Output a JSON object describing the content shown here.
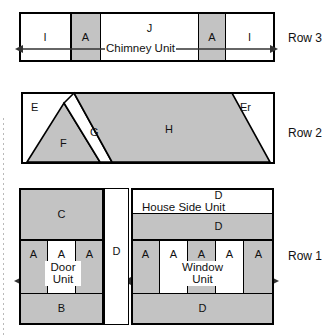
{
  "diagram": {
    "fill_gray": "#c3c3c3",
    "fill_white": "#ffffff",
    "line_color": "#000000"
  },
  "row_labels": {
    "row3": "Row 3",
    "row2": "Row 2",
    "row1": "Row 1"
  },
  "row3": {
    "name": "Chimney Unit",
    "unit_label": "Chimney Unit",
    "cells": [
      {
        "label": "I",
        "fill": "white"
      },
      {
        "label": "A",
        "fill": "gray"
      },
      {
        "label": "J",
        "fill": "white"
      },
      {
        "label": "A",
        "fill": "gray"
      },
      {
        "label": "I",
        "fill": "white"
      }
    ]
  },
  "row2": {
    "pieces": [
      {
        "label": "E",
        "fill": "white",
        "shape": "triangle-left"
      },
      {
        "label": "F",
        "fill": "gray",
        "shape": "triangle"
      },
      {
        "label": "G",
        "fill": "white",
        "shape": "parallelogram"
      },
      {
        "label": "H",
        "fill": "gray",
        "shape": "trapezoid"
      },
      {
        "label": "Er",
        "fill": "white",
        "shape": "triangle-right"
      }
    ]
  },
  "row1": {
    "left_block": {
      "top_piece": {
        "label": "C",
        "fill": "gray"
      },
      "door_unit": {
        "unit_label": "Door Unit",
        "unit_label_line1": "Door",
        "unit_label_line2": "Unit",
        "cells": [
          {
            "label": "A",
            "fill": "gray"
          },
          {
            "label": "A",
            "fill": "white"
          },
          {
            "label": "A",
            "fill": "gray"
          }
        ]
      },
      "bottom_piece": {
        "label": "B",
        "fill": "gray"
      }
    },
    "center_strip": {
      "label": "D",
      "fill": "white"
    },
    "right_block": {
      "house_side_unit": {
        "unit_label": "House Side Unit",
        "top_band": {
          "label": "D",
          "fill": "white"
        },
        "bottom_band": {
          "label": "D",
          "fill": "gray"
        }
      },
      "window_unit": {
        "unit_label": "Window Unit",
        "unit_label_line1": "Window",
        "unit_label_line2": "Unit",
        "cells": [
          {
            "label": "A",
            "fill": "gray"
          },
          {
            "label": "A",
            "fill": "white"
          },
          {
            "label": "A",
            "fill": "gray"
          },
          {
            "label": "A",
            "fill": "white"
          },
          {
            "label": "A",
            "fill": "gray"
          }
        ]
      },
      "bottom_piece": {
        "label": "D",
        "fill": "gray"
      }
    }
  }
}
